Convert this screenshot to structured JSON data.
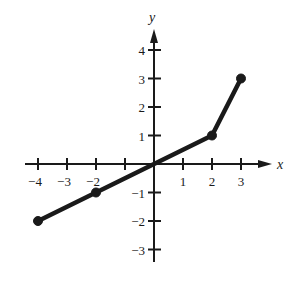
{
  "chart_data": {
    "type": "line",
    "title": "",
    "xlabel": "x",
    "ylabel": "y",
    "x_ticks": [
      -4,
      -3,
      -2,
      -1,
      1,
      2,
      3
    ],
    "x_tick_labels": [
      "−4",
      "−3",
      "−2",
      "",
      "1",
      "2",
      "3"
    ],
    "y_ticks": [
      -3,
      -2,
      -1,
      1,
      2,
      3,
      4
    ],
    "y_tick_labels": [
      "−3",
      "−2",
      "−1",
      "1",
      "2",
      "3",
      "4"
    ],
    "xlim": [
      -4.5,
      4
    ],
    "ylim": [
      -3.5,
      4.8
    ],
    "grid": false,
    "legend": null,
    "series": [
      {
        "name": "piecewise linear function",
        "x": [
          -4,
          -2,
          0,
          2,
          3
        ],
        "y": [
          -2,
          -1,
          0,
          1,
          3
        ],
        "markers": [
          {
            "x": -4,
            "y": -2,
            "filled": true
          },
          {
            "x": -2,
            "y": -1,
            "filled": true
          },
          {
            "x": 2,
            "y": 1,
            "filled": true
          },
          {
            "x": 3,
            "y": 3,
            "filled": true
          }
        ]
      }
    ]
  },
  "colors": {
    "ink": "#1a1a1a",
    "background": "#ffffff"
  }
}
